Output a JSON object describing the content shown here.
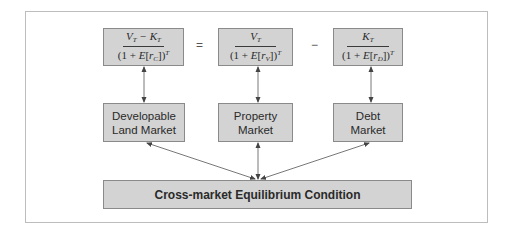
{
  "diagram": {
    "equation": {
      "left": {
        "numerator": [
          "V",
          "T",
          " − K",
          "T"
        ],
        "numerator_text": "V_T − K_T",
        "denominator_text": "(1 + E[r_C])^T",
        "rate_subscript": "C"
      },
      "equals_sign": "=",
      "middle": {
        "numerator_text": "V_T",
        "denominator_text": "(1 + E[r_V])^T",
        "rate_subscript": "V"
      },
      "minus_sign": "−",
      "right": {
        "numerator_text": "K_T",
        "denominator_text": "(1 + E[r_D])^T",
        "rate_subscript": "D"
      }
    },
    "markets": [
      {
        "line1": "Developable",
        "line2": "Land Market"
      },
      {
        "line1": "Property",
        "line2": "Market"
      },
      {
        "line1": "Debt",
        "line2": "Market"
      }
    ],
    "bottom_box": {
      "label": "Cross-market Equilibrium Condition"
    },
    "colors": {
      "box_fill": "#d3d3d3",
      "box_border": "#8a8a8a",
      "arrow": "#444444",
      "frame": "#bdbdbd"
    }
  }
}
